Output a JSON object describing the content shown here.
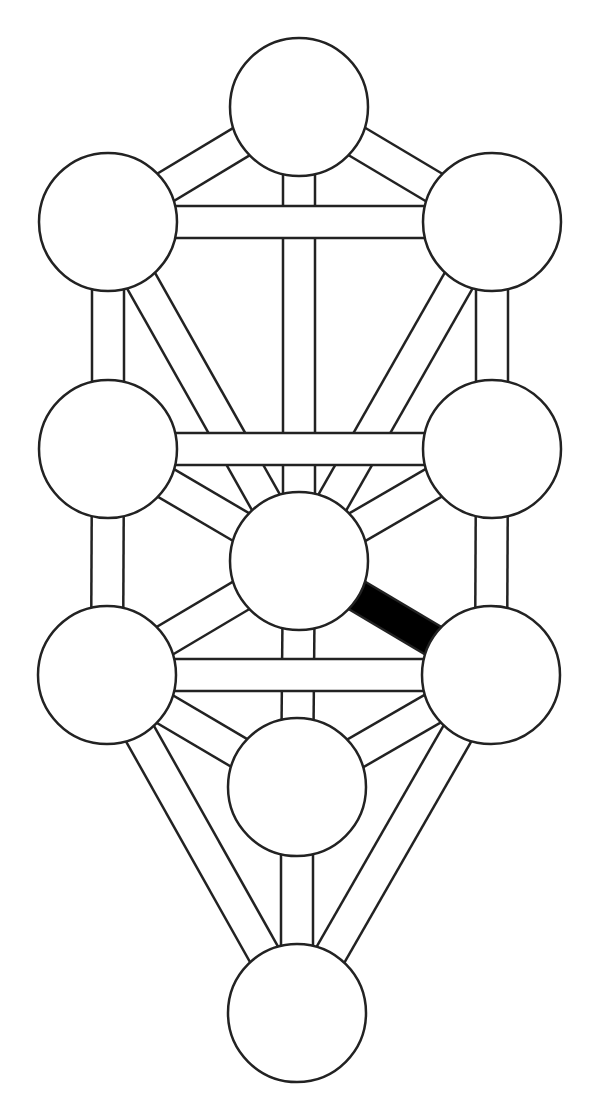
{
  "diagram": {
    "type": "tree-of-life",
    "width": 598,
    "height": 1112,
    "colors": {
      "background": "#ffffff",
      "stroke": "#222222",
      "node_fill": "#ffffff",
      "path_fill": "#ffffff",
      "highlight_fill": "#000000"
    },
    "node_radius": 69,
    "path_width": 32,
    "stroke_width": 2.5,
    "nodes": [
      {
        "id": "kether",
        "x": 299,
        "y": 107
      },
      {
        "id": "chokmah",
        "x": 492,
        "y": 222
      },
      {
        "id": "binah",
        "x": 108,
        "y": 222
      },
      {
        "id": "chesed",
        "x": 492,
        "y": 449
      },
      {
        "id": "geburah",
        "x": 108,
        "y": 449
      },
      {
        "id": "tiphareth",
        "x": 299,
        "y": 561
      },
      {
        "id": "netzach",
        "x": 491,
        "y": 675
      },
      {
        "id": "hod",
        "x": 107,
        "y": 675
      },
      {
        "id": "yesod",
        "x": 297,
        "y": 787
      },
      {
        "id": "malkuth",
        "x": 297,
        "y": 1013
      }
    ],
    "paths": [
      {
        "from": "kether",
        "to": "chokmah",
        "layer": 0,
        "highlight": false
      },
      {
        "from": "kether",
        "to": "binah",
        "layer": 0,
        "highlight": false
      },
      {
        "from": "kether",
        "to": "tiphareth",
        "layer": 0,
        "highlight": false
      },
      {
        "from": "chokmah",
        "to": "tiphareth",
        "layer": 0,
        "highlight": false
      },
      {
        "from": "binah",
        "to": "tiphareth",
        "layer": 0,
        "highlight": false
      },
      {
        "from": "chokmah",
        "to": "chesed",
        "layer": 0,
        "highlight": false
      },
      {
        "from": "binah",
        "to": "geburah",
        "layer": 0,
        "highlight": false
      },
      {
        "from": "chesed",
        "to": "tiphareth",
        "layer": 0,
        "highlight": false
      },
      {
        "from": "geburah",
        "to": "tiphareth",
        "layer": 0,
        "highlight": false
      },
      {
        "from": "chesed",
        "to": "netzach",
        "layer": 0,
        "highlight": false
      },
      {
        "from": "geburah",
        "to": "hod",
        "layer": 0,
        "highlight": false
      },
      {
        "from": "tiphareth",
        "to": "hod",
        "layer": 0,
        "highlight": false
      },
      {
        "from": "tiphareth",
        "to": "yesod",
        "layer": 0,
        "highlight": false
      },
      {
        "from": "netzach",
        "to": "yesod",
        "layer": 0,
        "highlight": false
      },
      {
        "from": "hod",
        "to": "yesod",
        "layer": 0,
        "highlight": false
      },
      {
        "from": "netzach",
        "to": "malkuth",
        "layer": 0,
        "highlight": false
      },
      {
        "from": "hod",
        "to": "malkuth",
        "layer": 0,
        "highlight": false
      },
      {
        "from": "yesod",
        "to": "malkuth",
        "layer": 0,
        "highlight": false
      },
      {
        "from": "chokmah",
        "to": "binah",
        "layer": 1,
        "highlight": false
      },
      {
        "from": "chesed",
        "to": "geburah",
        "layer": 1,
        "highlight": false
      },
      {
        "from": "netzach",
        "to": "hod",
        "layer": 1,
        "highlight": false
      },
      {
        "from": "tiphareth",
        "to": "netzach",
        "layer": 2,
        "highlight": true
      }
    ]
  }
}
